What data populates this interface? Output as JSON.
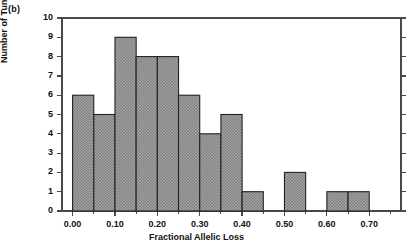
{
  "panel": {
    "label": "(b)"
  },
  "chart_data": {
    "type": "bar",
    "title": "",
    "subtitle": "",
    "xlabel": "Fractional Allelic Loss",
    "ylabel": "Number of Tumors",
    "xlim": [
      -0.025,
      0.775
    ],
    "ylim": [
      0,
      10
    ],
    "xtick_values": [
      0.0,
      0.1,
      0.2,
      0.3,
      0.4,
      0.5,
      0.6,
      0.7
    ],
    "xtick_labels": [
      "0.00",
      "0.10",
      "0.20",
      "0.30",
      "0.40",
      "0.50",
      "0.60",
      "0.70"
    ],
    "xminor_tick_values": [
      0.05,
      0.15,
      0.25,
      0.35,
      0.45,
      0.55,
      0.65,
      0.75
    ],
    "ytick_values": [
      0,
      1,
      2,
      3,
      4,
      5,
      6,
      7,
      8,
      9,
      10
    ],
    "ytick_labels": [
      "0",
      "1",
      "2",
      "3",
      "4",
      "5",
      "6",
      "7",
      "8",
      "9",
      "10"
    ],
    "bin_width": 0.05,
    "grid": false,
    "legend": null,
    "bar_fill": "#9a9a9a",
    "bar_edge": "#222222",
    "bar_hatch": "cross-hatch",
    "bins": [
      {
        "x0": 0.0,
        "x1": 0.05,
        "value": 6
      },
      {
        "x0": 0.05,
        "x1": 0.1,
        "value": 5
      },
      {
        "x0": 0.1,
        "x1": 0.15,
        "value": 9
      },
      {
        "x0": 0.15,
        "x1": 0.2,
        "value": 8
      },
      {
        "x0": 0.2,
        "x1": 0.25,
        "value": 8
      },
      {
        "x0": 0.25,
        "x1": 0.3,
        "value": 6
      },
      {
        "x0": 0.3,
        "x1": 0.35,
        "value": 4
      },
      {
        "x0": 0.35,
        "x1": 0.4,
        "value": 5
      },
      {
        "x0": 0.4,
        "x1": 0.45,
        "value": 1
      },
      {
        "x0": 0.45,
        "x1": 0.5,
        "value": 0
      },
      {
        "x0": 0.5,
        "x1": 0.55,
        "value": 2
      },
      {
        "x0": 0.55,
        "x1": 0.6,
        "value": 0
      },
      {
        "x0": 0.6,
        "x1": 0.65,
        "value": 1
      },
      {
        "x0": 0.65,
        "x1": 0.7,
        "value": 1
      },
      {
        "x0": 0.7,
        "x1": 0.75,
        "value": 0
      }
    ],
    "categories": [
      "0.00-0.05",
      "0.05-0.10",
      "0.10-0.15",
      "0.15-0.20",
      "0.20-0.25",
      "0.25-0.30",
      "0.30-0.35",
      "0.35-0.40",
      "0.40-0.45",
      "0.45-0.50",
      "0.50-0.55",
      "0.55-0.60",
      "0.60-0.65",
      "0.65-0.70",
      "0.70-0.75"
    ],
    "values": [
      6,
      5,
      9,
      8,
      8,
      6,
      4,
      5,
      1,
      0,
      2,
      0,
      1,
      1,
      0
    ]
  }
}
